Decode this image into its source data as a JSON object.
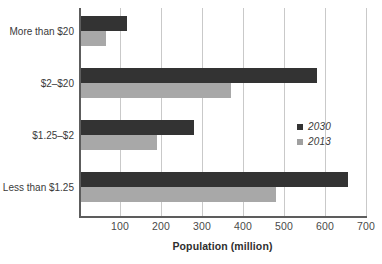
{
  "chart_data": {
    "type": "bar",
    "orientation": "horizontal",
    "title": "",
    "xlabel": "Population (million)",
    "ylabel": "",
    "categories": [
      "More than $20",
      "$2–$20",
      "$1.25–$2",
      "Less than $1.25"
    ],
    "series": [
      {
        "name": "2030",
        "color": "#333333",
        "values": [
          118,
          580,
          280,
          655
        ]
      },
      {
        "name": "2013",
        "color": "#a8a8a8",
        "values": [
          65,
          370,
          190,
          480
        ]
      }
    ],
    "xlim": [
      0,
      700
    ],
    "x_ticks": [
      100,
      200,
      300,
      400,
      500,
      600,
      700
    ],
    "x_tick_labels": [
      "100",
      "200",
      "300",
      "400",
      "500",
      "600",
      "700"
    ],
    "grid": "vertical",
    "legend_position": "inside-right"
  },
  "axis": {
    "x_title": "Population (million)",
    "x_tick_labels": [
      "100",
      "200",
      "300",
      "400",
      "500",
      "600",
      "700"
    ],
    "y_tick_labels": [
      "More than $20",
      "$2–$20",
      "$1.25–$2",
      "Less than $1.25"
    ]
  },
  "legend": {
    "items": [
      {
        "label": "2030",
        "color": "#333333"
      },
      {
        "label": "2013",
        "color": "#a0a0a0"
      }
    ]
  }
}
